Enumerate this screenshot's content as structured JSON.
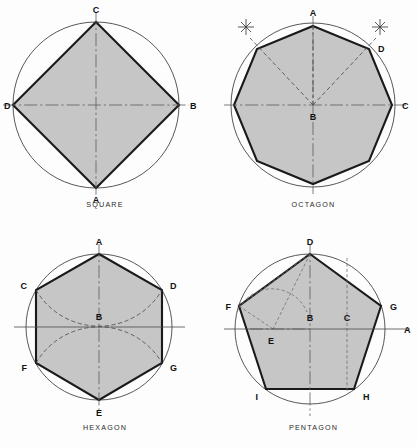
{
  "sheet": {
    "background_color": "#fdfdfd",
    "fill_color": "#c6c6c6",
    "outline_color": "#1a1a1a",
    "circle_color": "#3a3a3a",
    "centerline_color": "#5a5a5a"
  },
  "panels": [
    {
      "id": "square",
      "caption": "SQUARE",
      "shape_type": "square",
      "sides": 4,
      "circle": {
        "cx": 96,
        "cy": 105,
        "r": 83
      },
      "vertices": [
        {
          "label": "C",
          "x": 96,
          "y": 22,
          "label_x": 96,
          "label_y": 13
        },
        {
          "label": "B",
          "x": 179,
          "y": 105,
          "label_x": 190,
          "label_y": 109
        },
        {
          "label": "A",
          "x": 96,
          "y": 188,
          "label_x": 96,
          "label_y": 203
        },
        {
          "label": "D",
          "x": 13,
          "y": 105,
          "label_x": 4,
          "label_y": 109
        }
      ],
      "centerlines": [
        {
          "name": "horizontal-centerline",
          "x1": 3,
          "y1": 105,
          "x2": 189,
          "y2": 105
        },
        {
          "name": "vertical-centerline",
          "x1": 96,
          "y1": 12,
          "x2": 96,
          "y2": 198
        }
      ]
    },
    {
      "id": "octagon",
      "caption": "OCTAGON",
      "shape_type": "octagon",
      "sides": 8,
      "circle": {
        "cx": 103,
        "cy": 105,
        "r": 79
      },
      "vertices": [
        {
          "label": "A",
          "x": 103,
          "y": 26,
          "label_x": 103,
          "label_y": 15
        },
        {
          "label": "D",
          "x": 159,
          "y": 49,
          "label_x": 170,
          "label_y": 50
        },
        {
          "label": "C",
          "x": 182,
          "y": 105,
          "label_x": 193,
          "label_y": 109
        },
        {
          "label": "",
          "x": 159,
          "y": 161,
          "label_x": 0,
          "label_y": 0
        },
        {
          "label": "",
          "x": 103,
          "y": 184,
          "label_x": 0,
          "label_y": 0
        },
        {
          "label": "",
          "x": 47,
          "y": 161,
          "label_x": 0,
          "label_y": 0
        },
        {
          "label": "",
          "x": 24,
          "y": 105,
          "label_x": 0,
          "label_y": 0
        },
        {
          "label": "",
          "x": 47,
          "y": 49,
          "label_x": 0,
          "label_y": 0
        }
      ],
      "center_label": {
        "label": "B",
        "x": 103,
        "y": 105,
        "label_x": 103,
        "label_y": 119
      },
      "centerlines": [
        {
          "name": "horizontal-centerline",
          "x1": 14,
          "y1": 105,
          "x2": 196,
          "y2": 105
        },
        {
          "name": "vertical-centerline",
          "x1": 103,
          "y1": 16,
          "x2": 103,
          "y2": 194
        }
      ],
      "construction_rays": [
        {
          "name": "ray-upper-left",
          "x1": 103,
          "y1": 105,
          "x2": 38,
          "y2": 36
        },
        {
          "name": "ray-upper-right",
          "x1": 103,
          "y1": 105,
          "x2": 168,
          "y2": 36
        }
      ],
      "arc_marks": [
        {
          "name": "arc-mark-left",
          "x": 38,
          "y": 25
        },
        {
          "name": "arc-mark-right",
          "x": 168,
          "y": 25
        }
      ]
    },
    {
      "id": "hexagon",
      "caption": "HEXAGON",
      "shape_type": "hexagon",
      "sides": 6,
      "circle": {
        "cx": 99,
        "cy": 103,
        "r": 73
      },
      "vertices": [
        {
          "label": "A",
          "x": 99,
          "y": 30,
          "label_x": 99,
          "label_y": 20
        },
        {
          "label": "D",
          "x": 162,
          "y": 66,
          "label_x": 172,
          "label_y": 64
        },
        {
          "label": "G",
          "x": 162,
          "y": 139,
          "label_x": 172,
          "label_y": 145
        },
        {
          "label": "E",
          "x": 99,
          "y": 176,
          "label_x": 99,
          "label_y": 191
        },
        {
          "label": "F",
          "x": 36,
          "y": 139,
          "label_x": 25,
          "label_y": 145
        },
        {
          "label": "C",
          "x": 36,
          "y": 66,
          "label_x": 25,
          "label_y": 64
        }
      ],
      "center_label": {
        "label": "B",
        "x": 99,
        "y": 103,
        "label_x": 99,
        "label_y": 95
      },
      "centerlines": [
        {
          "name": "horizontal-centerline",
          "x1": 14,
          "y1": 103,
          "x2": 185,
          "y2": 103
        },
        {
          "name": "vertical-centerline",
          "x1": 99,
          "y1": 20,
          "x2": 99,
          "y2": 188
        }
      ],
      "construction_arcs": [
        {
          "name": "arc-from-a",
          "cx": 99,
          "cy": 30,
          "r": 73,
          "from_x": 36,
          "from_y": 66,
          "to_x": 162,
          "to_y": 66,
          "sweep": 0
        },
        {
          "name": "arc-from-e",
          "cx": 99,
          "cy": 176,
          "r": 73,
          "from_x": 36,
          "from_y": 139,
          "to_x": 162,
          "to_y": 139,
          "sweep": 1
        }
      ]
    },
    {
      "id": "pentagon",
      "caption": "PENTAGON",
      "shape_type": "pentagon",
      "sides": 5,
      "circle": {
        "cx": 100,
        "cy": 105,
        "r": 75
      },
      "vertices": [
        {
          "label": "D",
          "x": 100,
          "y": 30,
          "label_x": 100,
          "label_y": 20
        },
        {
          "label": "G",
          "x": 171,
          "y": 82,
          "label_x": 182,
          "label_y": 84
        },
        {
          "label": "H",
          "x": 144,
          "y": 165,
          "label_x": 155,
          "label_y": 173
        },
        {
          "label": "I",
          "x": 56,
          "y": 165,
          "label_x": 45,
          "label_y": 173
        },
        {
          "label": "F",
          "x": 29,
          "y": 82,
          "label_x": 18,
          "label_y": 84
        }
      ],
      "center_label": {
        "label": "B",
        "x": 100,
        "y": 105,
        "label_x": 100,
        "label_y": 96
      },
      "aux_labels": [
        {
          "label": "E",
          "x": 63,
          "y": 105,
          "label_x": 61,
          "label_y": 119
        },
        {
          "label": "C",
          "x": 137,
          "y": 105,
          "label_x": 137,
          "label_y": 96
        },
        {
          "label": "A",
          "x": 190,
          "y": 105,
          "label_x": 196,
          "label_y": 109
        }
      ],
      "centerlines": [
        {
          "name": "horizontal-centerline",
          "x1": 14,
          "y1": 105,
          "x2": 200,
          "y2": 105
        },
        {
          "name": "vertical-centerline",
          "x1": 100,
          "y1": 20,
          "x2": 100,
          "y2": 192
        }
      ],
      "construction_lines": [
        {
          "name": "line-d-to-e",
          "x1": 100,
          "y1": 30,
          "x2": 63,
          "y2": 105
        },
        {
          "name": "line-d-to-f",
          "x1": 100,
          "y1": 30,
          "x2": 29,
          "y2": 82
        },
        {
          "name": "line-e-to-f",
          "x1": 63,
          "y1": 105,
          "x2": 29,
          "y2": 82
        }
      ],
      "construction_arc": {
        "name": "arc-through-e",
        "cx": 63,
        "cy": 105,
        "r": 38,
        "from_x": 29,
        "from_y": 88,
        "to_x": 97,
        "to_y": 87
      },
      "drop_line": {
        "name": "drop-line-c-to-h",
        "x1": 137,
        "y1": 36,
        "x2": 137,
        "y2": 168
      }
    }
  ]
}
